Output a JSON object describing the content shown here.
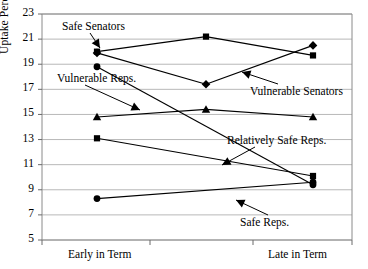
{
  "chart_data": {
    "type": "line",
    "title": "",
    "xlabel": "",
    "ylabel": "Uptake Percentage",
    "x": [
      "Early in Term",
      "Mid Term",
      "Late in Term"
    ],
    "xtick_labels": [
      "Early in Term",
      "Late in Term"
    ],
    "ytick_labels": [
      "5",
      "7",
      "9",
      "11",
      "13",
      "15",
      "17",
      "19",
      "21",
      "23"
    ],
    "ylim": [
      5,
      23
    ],
    "ystep": 2,
    "grid": true,
    "legend_position": "annotations",
    "series": [
      {
        "name": "Safe Senators",
        "marker": "square",
        "values": [
          20.0,
          21.2,
          19.7
        ]
      },
      {
        "name": "Vulnerable Senators",
        "marker": "diamond",
        "values": [
          19.9,
          17.4,
          20.5
        ]
      },
      {
        "name": "Vulnerable Reps.",
        "marker": "triangle",
        "values": [
          14.8,
          15.4,
          14.8
        ]
      },
      {
        "name": "Relatively Safe Reps.",
        "marker": "square",
        "values": [
          13.1,
          null,
          10.1
        ]
      },
      {
        "name": "Safe Reps.",
        "marker": "circle",
        "values": [
          8.3,
          null,
          9.6
        ]
      },
      {
        "name": "Senators upper",
        "marker": "circle",
        "values": [
          18.8,
          null,
          9.4
        ]
      }
    ],
    "annotations": [
      {
        "text": "Safe Senators",
        "label_x": 62,
        "label_y": 28,
        "tip_x": 100,
        "tip_y": 48
      },
      {
        "text": "Vulnerable Reps.",
        "label_x": 57,
        "label_y": 80,
        "tip_x": 140,
        "tip_y": 110
      },
      {
        "text": "Vulnerable Senators",
        "label_x": 250,
        "label_y": 93,
        "tip_x": 242,
        "tip_y": 72
      },
      {
        "text": "Relatively Safe Reps.",
        "label_x": 227,
        "label_y": 142,
        "tip_x": 222,
        "tip_y": 165
      },
      {
        "text": "Safe Reps.",
        "label_x": 240,
        "label_y": 224,
        "tip_x": 236,
        "tip_y": 200
      }
    ]
  }
}
